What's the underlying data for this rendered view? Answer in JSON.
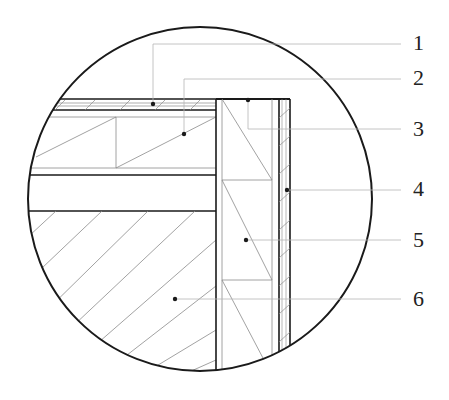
{
  "diagram": {
    "type": "construction-detail-section",
    "colors": {
      "outline": "#1a1a1a",
      "thin_line": "#8a8a8a",
      "leader_line": "#b5b5b5",
      "label": "#222222",
      "background": "#ffffff"
    },
    "callouts": [
      {
        "number": "1",
        "label_x": 413,
        "label_y": 32,
        "leader_y": 44,
        "dot_x": 153,
        "dot_y": 104
      },
      {
        "number": "2",
        "label_x": 413,
        "label_y": 67,
        "leader_y": 79,
        "dot_x": 184,
        "dot_y": 134
      },
      {
        "number": "3",
        "label_x": 413,
        "label_y": 118,
        "leader_y": 129,
        "dot_x": 248,
        "dot_y": 100
      },
      {
        "number": "4",
        "label_x": 413,
        "label_y": 178,
        "leader_y": 190,
        "dot_x": 287,
        "dot_y": 190
      },
      {
        "number": "5",
        "label_x": 413,
        "label_y": 229,
        "leader_y": 240,
        "dot_x": 246,
        "dot_y": 240
      },
      {
        "number": "6",
        "label_x": 413,
        "label_y": 288,
        "leader_y": 299,
        "dot_x": 175,
        "dot_y": 299
      }
    ]
  }
}
